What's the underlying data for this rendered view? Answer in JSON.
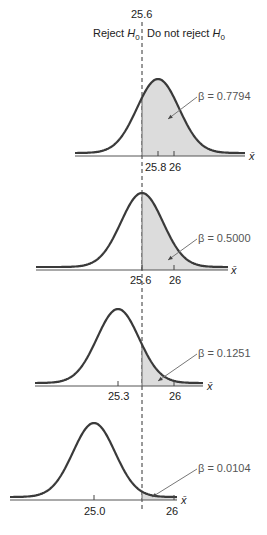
{
  "chart_data": {
    "type": "area",
    "title": "",
    "critical_value": 25.6,
    "critical_label": "25.6",
    "regions": {
      "left": "Reject H0",
      "right": "Do not reject H0"
    },
    "xlabel": "x̄",
    "panels": [
      {
        "mean": 25.8,
        "beta": 0.7794,
        "beta_label": "β = 0.7794",
        "ticks": [
          "25.8",
          "26"
        ]
      },
      {
        "mean": 25.6,
        "beta": 0.5,
        "beta_label": "β = 0.5000",
        "ticks": [
          "25.6",
          "26"
        ]
      },
      {
        "mean": 25.3,
        "beta": 0.1251,
        "beta_label": "β = 0.1251",
        "ticks": [
          "25.3",
          "26"
        ]
      },
      {
        "mean": 25.0,
        "beta": 0.0104,
        "beta_label": "β = 0.0104",
        "ticks": [
          "25.0",
          "26"
        ]
      }
    ],
    "colors": {
      "curve": "#3a3a3a",
      "shade": "#dcdcdc",
      "axis": "#555555",
      "arrow": "#777777"
    }
  },
  "labels": {
    "critical": "25.6",
    "reject": "Reject ",
    "do_not_reject": "Do not reject ",
    "H": "H",
    "sub0": "0",
    "xbar": "x̄",
    "p1_beta": "β = 0.7794",
    "p2_beta": "β = 0.5000",
    "p3_beta": "β = 0.1251",
    "p4_beta": "β = 0.0104",
    "p1_t1": "25.8",
    "p1_t2": "26",
    "p2_t1": "25.6",
    "p2_t2": "26",
    "p3_t1": "25.3",
    "p3_t2": "26",
    "p4_t1": "25.0",
    "p4_t2": "26"
  }
}
